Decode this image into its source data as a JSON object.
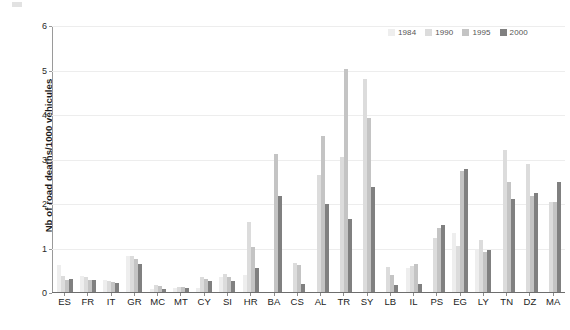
{
  "chart_data": {
    "type": "bar",
    "title": "",
    "subtitle": "",
    "xlabel": "",
    "ylabel": "Nb of road deaths/1000 véhicules",
    "ylim": [
      0,
      6
    ],
    "yticks": [
      0,
      1,
      2,
      3,
      4,
      5,
      6
    ],
    "ytick_labels": [
      "0",
      "1",
      "2",
      "3",
      "4",
      "5",
      "6"
    ],
    "grid": "horizontal",
    "legend_position": "top-right",
    "categories": [
      "ES",
      "FR",
      "IT",
      "GR",
      "MC",
      "MT",
      "CY",
      "SI",
      "HR",
      "BA",
      "CS",
      "AL",
      "TR",
      "SY",
      "LB",
      "IL",
      "PS",
      "EG",
      "LY",
      "TN",
      "DZ",
      "MA"
    ],
    "series": [
      {
        "name": "1984",
        "color": "#eeeeee",
        "values": [
          0.6,
          0.36,
          0.28,
          0.8,
          0.07,
          0.1,
          0.1,
          0.33,
          0.38,
          0.0,
          0.0,
          0.0,
          0.0,
          0.0,
          0.0,
          0.55,
          0.0,
          1.33,
          0.95,
          0.0,
          0.0,
          0.0
        ]
      },
      {
        "name": "1990",
        "color": "#dcdcdc",
        "values": [
          0.35,
          0.33,
          0.25,
          0.8,
          0.16,
          0.11,
          0.33,
          0.4,
          1.57,
          0.0,
          0.65,
          2.63,
          3.03,
          4.78,
          0.57,
          0.58,
          1.22,
          1.04,
          1.18,
          3.2,
          2.87,
          2.02
        ]
      },
      {
        "name": "1995",
        "color": "#c4c4c4",
        "values": [
          0.28,
          0.28,
          0.22,
          0.75,
          0.13,
          0.11,
          0.29,
          0.33,
          1.02,
          3.11,
          0.6,
          3.5,
          5.02,
          3.92,
          0.38,
          0.62,
          1.44,
          2.73,
          0.91,
          2.47,
          2.15,
          2.03
        ]
      },
      {
        "name": "2000",
        "color": "#808080",
        "values": [
          0.3,
          0.26,
          0.2,
          0.62,
          0.07,
          0.1,
          0.25,
          0.25,
          0.54,
          2.15,
          0.17,
          1.97,
          1.63,
          2.35,
          0.16,
          0.18,
          1.51,
          2.77,
          0.95,
          2.1,
          2.23,
          2.48
        ]
      }
    ],
    "legend": [
      {
        "label": "1984",
        "color": "#eeeeee"
      },
      {
        "label": "1990",
        "color": "#dcdcdc"
      },
      {
        "label": "1995",
        "color": "#c4c4c4"
      },
      {
        "label": "2000",
        "color": "#808080"
      }
    ]
  }
}
